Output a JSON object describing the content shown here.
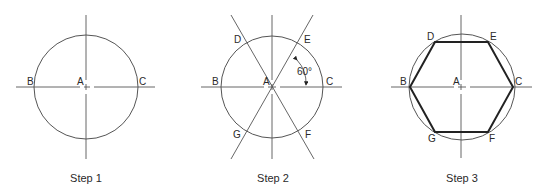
{
  "figure": {
    "steps": [
      {
        "caption": "Step 1",
        "labels": {
          "center": "A",
          "left": "B",
          "right": "C"
        }
      },
      {
        "caption": "Step 2",
        "labels": {
          "center": "A",
          "left": "B",
          "right": "C",
          "top_left": "D",
          "top_right": "E",
          "bottom_right": "F",
          "bottom_left": "G"
        },
        "angle_label": "60°"
      },
      {
        "caption": "Step 3",
        "labels": {
          "center": "A",
          "left": "B",
          "right": "C",
          "top_left": "D",
          "top_right": "E",
          "bottom_right": "F",
          "bottom_left": "G"
        }
      }
    ]
  }
}
